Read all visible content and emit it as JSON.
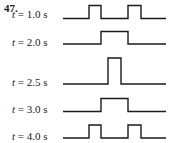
{
  "problem_number": "47.",
  "waveforms": [
    {
      "var": "t",
      "label": " = 1.0 s",
      "y_base": 18.5,
      "y_top": 5.5,
      "pulses": [
        [
          89,
          101
        ],
        [
          128,
          141
        ]
      ],
      "label_top": 8
    },
    {
      "var": "t",
      "label": " = 2.0 s",
      "y_base": 44,
      "y_top": 31.5,
      "pulses": [
        [
          101,
          128
        ]
      ],
      "label_top": 36
    },
    {
      "var": "t",
      "label": " = 2.5 s",
      "y_base": 84,
      "y_top": 58,
      "pulses": [
        [
          108,
          121
        ]
      ],
      "label_top": 76
    },
    {
      "var": "t",
      "label": " = 3.0 s",
      "y_base": 111.5,
      "y_top": 98.5,
      "pulses": [
        [
          101,
          128
        ]
      ],
      "label_top": 103
    },
    {
      "var": "t",
      "label": " = 4.0 s",
      "y_base": 138,
      "y_top": 125,
      "pulses": [
        [
          89,
          101
        ],
        [
          128,
          141
        ]
      ],
      "label_top": 130
    }
  ],
  "line_x_start": 63,
  "line_x_end": 166,
  "stroke_color": "#1a1a1a"
}
